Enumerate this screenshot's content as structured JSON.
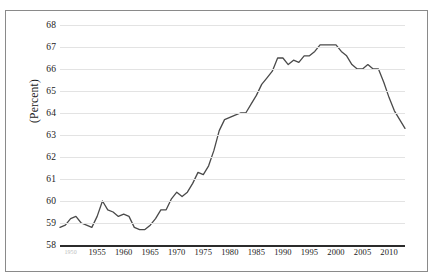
{
  "figure": {
    "caption_clipped": "",
    "border_color": "#8a8a8a",
    "background": "#ffffff"
  },
  "axes": {
    "y_title": "(Percent)",
    "y_ticks": [
      "68",
      "67",
      "66",
      "65",
      "64",
      "63",
      "62",
      "61",
      "60",
      "59",
      "58"
    ],
    "x_ticks": [
      "1950",
      "1955",
      "1960",
      "1965",
      "1970",
      "1975",
      "1980",
      "1985",
      "1990",
      "1995",
      "2000",
      "2005",
      "2010"
    ],
    "grid_color": "#e3e3e3",
    "axis_color": "#2b2b2b"
  },
  "chart_data": {
    "type": "line",
    "title": "",
    "subtitle": "",
    "xlabel": "",
    "ylabel": "(Percent)",
    "xlim": [
      1948,
      2013
    ],
    "ylim": [
      58,
      68
    ],
    "grid": true,
    "legend": "none",
    "line_color": "#4a4a4a",
    "x": [
      1948,
      1949,
      1950,
      1951,
      1952,
      1953,
      1954,
      1955,
      1956,
      1957,
      1958,
      1959,
      1960,
      1961,
      1962,
      1963,
      1964,
      1965,
      1966,
      1967,
      1968,
      1969,
      1970,
      1971,
      1972,
      1973,
      1974,
      1975,
      1976,
      1977,
      1978,
      1979,
      1980,
      1981,
      1982,
      1983,
      1984,
      1985,
      1986,
      1987,
      1988,
      1989,
      1990,
      1991,
      1992,
      1993,
      1994,
      1995,
      1996,
      1997,
      1998,
      1999,
      2000,
      2001,
      2002,
      2003,
      2004,
      2005,
      2006,
      2007,
      2008,
      2009,
      2010,
      2011,
      2012,
      2013
    ],
    "values": [
      58.8,
      58.9,
      59.2,
      59.3,
      59.0,
      58.9,
      58.8,
      59.3,
      60.0,
      59.6,
      59.5,
      59.3,
      59.4,
      59.3,
      58.8,
      58.7,
      58.7,
      58.9,
      59.2,
      59.6,
      59.6,
      60.1,
      60.4,
      60.2,
      60.4,
      60.8,
      61.3,
      61.2,
      61.6,
      62.3,
      63.2,
      63.7,
      63.8,
      63.9,
      64.0,
      64.0,
      64.4,
      64.8,
      65.3,
      65.6,
      65.9,
      66.5,
      66.5,
      66.2,
      66.4,
      66.3,
      66.6,
      66.6,
      66.8,
      67.1,
      67.1,
      67.1,
      67.1,
      66.8,
      66.6,
      66.2,
      66.0,
      66.0,
      66.2,
      66.0,
      66.0,
      65.4,
      64.7,
      64.1,
      63.7,
      63.3
    ],
    "series": [
      {
        "name": "Labor force participation rate",
        "values": [
          58.8,
          58.9,
          59.2,
          59.3,
          59.0,
          58.9,
          58.8,
          59.3,
          60.0,
          59.6,
          59.5,
          59.3,
          59.4,
          59.3,
          58.8,
          58.7,
          58.7,
          58.9,
          59.2,
          59.6,
          59.6,
          60.1,
          60.4,
          60.2,
          60.4,
          60.8,
          61.3,
          61.2,
          61.6,
          62.3,
          63.2,
          63.7,
          63.8,
          63.9,
          64.0,
          64.0,
          64.4,
          64.8,
          65.3,
          65.6,
          65.9,
          66.5,
          66.5,
          66.2,
          66.4,
          66.3,
          66.6,
          66.6,
          66.8,
          67.1,
          67.1,
          67.1,
          67.1,
          66.8,
          66.6,
          66.2,
          66.0,
          66.0,
          66.2,
          66.0,
          66.0,
          65.4,
          64.7,
          64.1,
          63.7,
          63.3
        ]
      }
    ]
  }
}
